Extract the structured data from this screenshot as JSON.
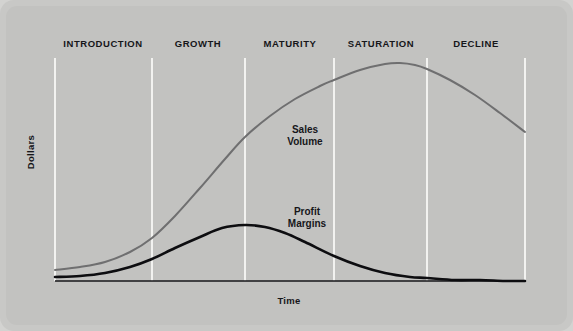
{
  "chart_data": {
    "type": "line",
    "title": "",
    "xlabel": "Time",
    "ylabel": "Dollars",
    "grid": false,
    "legend_position": "inline-annotations",
    "xlim": [
      0,
      100
    ],
    "ylim": [
      0,
      100
    ],
    "stages": [
      {
        "name": "INTRODUCTION",
        "x_center": 103,
        "x_start": 55,
        "x_end": 152
      },
      {
        "name": "GROWTH",
        "x_center": 198,
        "x_start": 152,
        "x_end": 245
      },
      {
        "name": "MATURITY",
        "x_center": 290,
        "x_start": 245,
        "x_end": 334
      },
      {
        "name": "SATURATION",
        "x_center": 381,
        "x_start": 334,
        "x_end": 427
      },
      {
        "name": "DECLINE",
        "x_center": 476,
        "x_start": 427,
        "x_end": 525
      }
    ],
    "dividers_x": [
      55,
      152,
      245,
      334,
      427,
      525
    ],
    "series": [
      {
        "name": "Sales Volume",
        "label_line1": "Sales",
        "label_line2": "Volume",
        "color": "#6f6f70",
        "label_x": 305,
        "label_y": 130,
        "points": [
          [
            55,
            270
          ],
          [
            80,
            267
          ],
          [
            105,
            262
          ],
          [
            130,
            252
          ],
          [
            152,
            238
          ],
          [
            175,
            216
          ],
          [
            200,
            188
          ],
          [
            225,
            159
          ],
          [
            245,
            137
          ],
          [
            270,
            116
          ],
          [
            295,
            99
          ],
          [
            320,
            86
          ],
          [
            334,
            80
          ],
          [
            360,
            70
          ],
          [
            385,
            64
          ],
          [
            400,
            63
          ],
          [
            415,
            65
          ],
          [
            427,
            69
          ],
          [
            450,
            80
          ],
          [
            475,
            95
          ],
          [
            500,
            113
          ],
          [
            525,
            132
          ]
        ]
      },
      {
        "name": "Profit Margins",
        "label_line1": "Profit",
        "label_line2": "Margins",
        "color": "#0d0d10",
        "label_x": 307,
        "label_y": 212,
        "points": [
          [
            55,
            277
          ],
          [
            80,
            276
          ],
          [
            105,
            273
          ],
          [
            130,
            267
          ],
          [
            152,
            259
          ],
          [
            175,
            248
          ],
          [
            200,
            237
          ],
          [
            222,
            228
          ],
          [
            245,
            225
          ],
          [
            265,
            227
          ],
          [
            285,
            233
          ],
          [
            305,
            242
          ],
          [
            334,
            256
          ],
          [
            360,
            266
          ],
          [
            385,
            273
          ],
          [
            410,
            277
          ],
          [
            427,
            278
          ],
          [
            455,
            280
          ],
          [
            480,
            280
          ],
          [
            505,
            281
          ],
          [
            525,
            281
          ]
        ]
      }
    ],
    "axis": {
      "baseline_y": 281,
      "baseline_x_start": 55,
      "baseline_x_end": 525,
      "top_y": 58
    }
  },
  "colors": {
    "background": "#c2c2c0",
    "frame": "#c8c8c6",
    "divider": "#f2f2f0",
    "sales_curve": "#6f6f70",
    "profit_curve": "#0d0d10",
    "text": "#16161a"
  },
  "labels": {
    "stage_0": "INTRODUCTION",
    "stage_1": "GROWTH",
    "stage_2": "MATURITY",
    "stage_3": "SATURATION",
    "stage_4": "DECLINE",
    "sales_line1": "Sales",
    "sales_line2": "Volume",
    "profit_line1": "Profit",
    "profit_line2": "Margins",
    "ylabel": "Dollars",
    "xlabel": "Time"
  }
}
